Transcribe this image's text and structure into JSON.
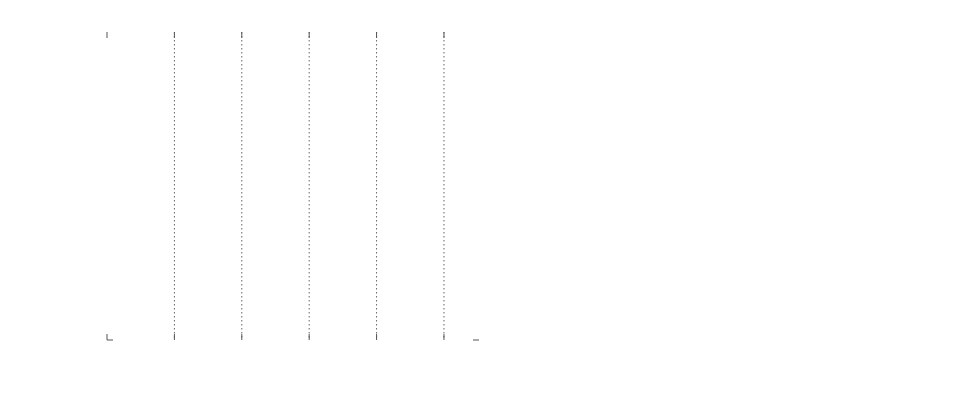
{
  "chart_data": [
    {
      "type": "line",
      "title": "",
      "xlabel": "n",
      "ylabel": "time in seconds",
      "x_tick_labels": [
        {
          "base": "10",
          "exp": "0"
        },
        {
          "base": "10",
          "exp": "5"
        },
        {
          "base": "10",
          "exp": "5"
        },
        {
          "base": "10",
          "exp": "5"
        },
        {
          "base": "10",
          "exp": "5"
        },
        {
          "base": "10",
          "exp": "6"
        }
      ],
      "x_tick_positions": [
        0,
        1,
        2,
        3,
        4,
        5
      ],
      "xlim": [
        0,
        5.52
      ],
      "y_ticks": [
        0,
        50,
        100,
        150,
        200,
        250,
        300
      ],
      "ylim": [
        0,
        320
      ],
      "grid": true,
      "legend_position": "upper left",
      "series": [
        {
          "name": "p=0.1, naive",
          "color": "#4f4f4f",
          "width": 2.2,
          "x": [
            0.04,
            0.1,
            0.2,
            0.3,
            0.4,
            0.46
          ],
          "y": [
            0,
            8,
            25,
            55,
            100,
            135
          ]
        },
        {
          "name": "p=0.5, naive",
          "color": "#6a6a6a",
          "width": 1.8,
          "x": [
            0.04,
            0.1,
            0.2,
            0.3,
            0.4,
            0.46
          ],
          "y": [
            0,
            8,
            24,
            54,
            98,
            132
          ]
        },
        {
          "name": "p=0.9, naive",
          "color": "#a8a8a8",
          "width": 1.8,
          "x": [
            0.04,
            0.1,
            0.2,
            0.3,
            0.4,
            0.46
          ],
          "y": [
            0,
            7,
            23,
            52,
            96,
            128
          ]
        },
        {
          "name": "p=0.1, fast",
          "color": "#9a9a9a",
          "width": 1.6,
          "x": [
            0.04,
            0.5,
            1.0,
            1.5,
            2.0,
            2.5,
            3.0,
            3.5,
            4.0,
            4.5,
            5.0,
            5.45
          ],
          "y": [
            0,
            8,
            22,
            35,
            48,
            62,
            77,
            93,
            110,
            128,
            152,
            183
          ]
        },
        {
          "name": "p=0.5, fast",
          "color": "#d8d8d8",
          "width": 1.4,
          "x": [
            0.04,
            0.5,
            1.0,
            1.5,
            2.0,
            2.5,
            3.0,
            3.5,
            4.0,
            4.5,
            5.0,
            5.45
          ],
          "y": [
            0,
            9,
            23,
            37,
            55,
            78,
            102,
            138,
            172,
            205,
            245,
            280
          ]
        },
        {
          "name": "p=0.9 fast",
          "color": "#5a5a5a",
          "width": 2.2,
          "x": [
            0.04,
            0.5,
            1.0,
            1.5,
            2.0,
            2.5,
            2.8,
            3.0,
            3.5,
            4.0,
            4.5,
            5.0,
            5.45
          ],
          "y": [
            0,
            9,
            24,
            38,
            58,
            82,
            95,
            110,
            162,
            205,
            245,
            283,
            313
          ]
        }
      ]
    },
    {
      "type": "line",
      "title": "",
      "xlabel": "n",
      "ylabel": "time in seconds",
      "x_scale": "log",
      "y_scale": "log",
      "x_tick_labels": [
        {
          "base": "10",
          "exp": "4"
        },
        {
          "base": "10",
          "exp": "5"
        },
        {
          "base": "10",
          "exp": "6"
        }
      ],
      "x_tick_values": [
        10000,
        100000,
        1000000
      ],
      "xlim": [
        10000,
        1050000
      ],
      "y_ticks": [
        1,
        10,
        100
      ],
      "y_tick_labels": [
        "1",
        "10",
        "100"
      ],
      "ylim": [
        0.4,
        320
      ],
      "grid": true,
      "legend_position": "lower right",
      "series": [
        {
          "name": "p=0.1, naive",
          "color": "#4f4f4f",
          "width": 2.2,
          "x": [
            12500,
            15000,
            20000,
            25000,
            30000,
            40000,
            50000,
            60000,
            75000,
            95000
          ],
          "y": [
            2.0,
            2.9,
            5.0,
            7.3,
            10.5,
            18,
            28,
            42,
            70,
            128
          ]
        },
        {
          "name": "p=0.5, naive",
          "color": "#6a6a6a",
          "width": 1.8,
          "x": [
            12500,
            15000,
            20000,
            25000,
            28000,
            30000,
            40000,
            50000,
            60000,
            75000,
            95000
          ],
          "y": [
            1.9,
            2.8,
            4.9,
            7.2,
            9.8,
            11.5,
            17.5,
            27,
            40,
            68,
            124
          ]
        },
        {
          "name": "p=0.9, naive",
          "color": "#a8a8a8",
          "width": 1.8,
          "x": [
            12500,
            15000,
            20000,
            25000,
            28000,
            30000,
            40000,
            50000,
            60000,
            75000,
            95000
          ],
          "y": [
            1.8,
            2.7,
            4.8,
            7.0,
            10.5,
            12.5,
            17.8,
            27.5,
            41,
            70,
            130
          ]
        },
        {
          "name": "p=0.1, fast",
          "color": "#9a9a9a",
          "width": 1.6,
          "x": [
            12500,
            15000,
            20000,
            25000,
            30000,
            40000,
            50000,
            60000,
            75000,
            100000,
            150000,
            200000,
            300000,
            400000,
            500000,
            700000,
            1000000
          ],
          "y": [
            0.68,
            0.78,
            1.1,
            1.5,
            1.85,
            2.6,
            3.3,
            4.3,
            5.8,
            8.2,
            15,
            24,
            38,
            52,
            68,
            100,
            175
          ]
        },
        {
          "name": "p=0.5, fast",
          "color": "#d8d8d8",
          "width": 1.4,
          "x": [
            12500,
            15000,
            20000,
            25000,
            30000,
            40000,
            50000,
            60000,
            75000,
            100000,
            150000,
            200000,
            300000,
            400000,
            500000,
            700000,
            1000000
          ],
          "y": [
            0.6,
            0.68,
            0.95,
            1.3,
            1.6,
            2.3,
            3.0,
            3.9,
            5.3,
            8.0,
            15,
            25,
            40,
            60,
            85,
            140,
            240
          ]
        },
        {
          "name": "p=0.9 fast",
          "color": "#5a5a5a",
          "width": 2.2,
          "x": [
            12500,
            15000,
            18000,
            20000,
            25000,
            30000,
            40000,
            50000,
            60000,
            75000,
            100000,
            150000,
            200000,
            250000,
            300000,
            400000,
            500000,
            700000,
            1000000,
            1050000
          ],
          "y": [
            0.45,
            0.53,
            0.62,
            0.72,
            0.86,
            1.1,
            1.6,
            2.2,
            2.9,
            4.1,
            6.8,
            13.5,
            24,
            32,
            41,
            62,
            95,
            160,
            280,
            310
          ]
        }
      ]
    }
  ]
}
